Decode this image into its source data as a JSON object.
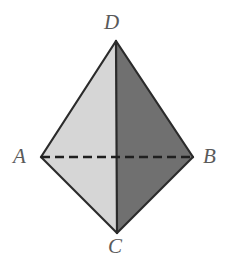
{
  "figure": {
    "name": "tetrahedron-diagram",
    "background_color": "#ffffff",
    "canvas": {
      "width": 232,
      "height": 264
    },
    "styles": {
      "edge_color": "#2b2b2b",
      "edge_width": 2.2,
      "hidden_edge_color": "#1f1f1f",
      "hidden_edge_width": 2.4,
      "hidden_edge_dash": "9 5",
      "face_light_color": "#d6d6d6",
      "face_dark_color": "#707070",
      "label_color": "#5a5a5a",
      "label_font_size": 21
    },
    "vertices": [
      {
        "id": "D",
        "label": "D",
        "x": 116,
        "y": 41,
        "label_x": 104,
        "label_y": 12
      },
      {
        "id": "A",
        "label": "A",
        "x": 41,
        "y": 157,
        "label_x": 13,
        "label_y": 146
      },
      {
        "id": "B",
        "label": "B",
        "x": 193,
        "y": 157,
        "label_x": 203,
        "label_y": 146
      },
      {
        "id": "C",
        "label": "C",
        "x": 117,
        "y": 233,
        "label_x": 108,
        "label_y": 236
      }
    ],
    "faces": [
      {
        "id": "face-ADC-left-upper",
        "name": "upper-left-face",
        "points": "116,41 41,157 116,157",
        "fill": "#d6d6d6"
      },
      {
        "id": "face-BDC-right-upper",
        "name": "upper-right-face",
        "points": "116,41 193,157 116,157",
        "fill": "#707070"
      },
      {
        "id": "face-ADC-left-lower",
        "name": "lower-left-face",
        "points": "41,157 117,233 116,157",
        "fill": "#d6d6d6"
      },
      {
        "id": "face-BDC-right-lower",
        "name": "lower-right-face",
        "points": "193,157 117,233 116,157",
        "fill": "#707070"
      }
    ],
    "solid_edges": [
      {
        "id": "edge-DA",
        "name": "edge-d-a",
        "x1": 116,
        "y1": 41,
        "x2": 41,
        "y2": 157
      },
      {
        "id": "edge-DB",
        "name": "edge-d-b",
        "x1": 116,
        "y1": 41,
        "x2": 193,
        "y2": 157
      },
      {
        "id": "edge-AC",
        "name": "edge-a-c",
        "x1": 41,
        "y1": 157,
        "x2": 117,
        "y2": 233
      },
      {
        "id": "edge-BC",
        "name": "edge-b-c",
        "x1": 193,
        "y1": 157,
        "x2": 117,
        "y2": 233
      },
      {
        "id": "edge-DC",
        "name": "edge-d-c",
        "x1": 116,
        "y1": 41,
        "x2": 117,
        "y2": 233
      }
    ],
    "hidden_edges": [
      {
        "id": "edge-AB",
        "name": "edge-a-b-hidden",
        "x1": 41,
        "y1": 157,
        "x2": 193,
        "y2": 157
      }
    ]
  }
}
